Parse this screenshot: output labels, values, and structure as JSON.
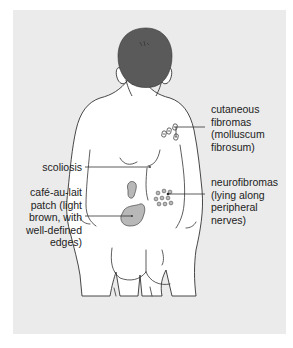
{
  "figure": {
    "colors": {
      "background_panel": "#ebebeb",
      "page": "#ffffff",
      "hair": "#5a5a5a",
      "skin": "#ffffff",
      "outline": "#333333",
      "lesion_fill": "#b8b8b8",
      "text": "#222222"
    }
  },
  "labels": {
    "cutaneous_fibromas": [
      "cutaneous",
      "fibromas",
      "(molluscum",
      "fibrosum)"
    ],
    "scoliosis": [
      "scoliosis"
    ],
    "cafe_au_lait": [
      "café-au-lait",
      "patch (light",
      "brown, with",
      "well-defined",
      "edges)"
    ],
    "neurofibromas": [
      "neurofibromas",
      "(lying along",
      "peripheral",
      "nerves)"
    ]
  }
}
